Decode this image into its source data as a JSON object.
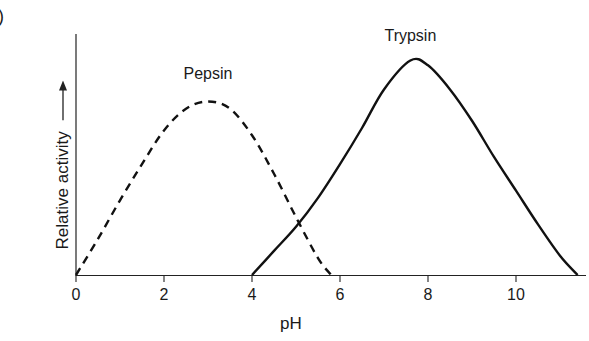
{
  "panel_mark": ")",
  "chart_data": {
    "type": "line",
    "title": "",
    "xlabel": "pH",
    "ylabel": "Relative activity",
    "ylabel_arrow": "→",
    "xlim": [
      0,
      11.4
    ],
    "ylim": [
      0,
      1
    ],
    "xticks": [
      0,
      2,
      4,
      6,
      8,
      10
    ],
    "xtick_labels": [
      "0",
      "2",
      "4",
      "6",
      "8",
      "10"
    ],
    "yticks": [],
    "grid": false,
    "legend": "none (curves labeled inline)",
    "series": [
      {
        "name": "Pepsin",
        "style": "dashed",
        "color": "#111111",
        "label_position": {
          "x": 3.0,
          "y": 0.82
        },
        "points": [
          [
            0,
            0
          ],
          [
            0.5,
            0.15
          ],
          [
            1,
            0.31
          ],
          [
            1.5,
            0.46
          ],
          [
            2,
            0.6
          ],
          [
            2.5,
            0.69
          ],
          [
            3,
            0.72
          ],
          [
            3.5,
            0.69
          ],
          [
            4,
            0.58
          ],
          [
            4.5,
            0.42
          ],
          [
            5,
            0.24
          ],
          [
            5.5,
            0.07
          ],
          [
            5.8,
            0
          ]
        ]
      },
      {
        "name": "Trypsin",
        "style": "solid",
        "color": "#111111",
        "label_position": {
          "x": 7.6,
          "y": 0.98
        },
        "points": [
          [
            4,
            0
          ],
          [
            4.5,
            0.1
          ],
          [
            5,
            0.2
          ],
          [
            5.5,
            0.32
          ],
          [
            6,
            0.46
          ],
          [
            6.5,
            0.61
          ],
          [
            7,
            0.77
          ],
          [
            7.6,
            0.89
          ],
          [
            8,
            0.87
          ],
          [
            8.5,
            0.77
          ],
          [
            9,
            0.64
          ],
          [
            9.5,
            0.49
          ],
          [
            10,
            0.35
          ],
          [
            10.5,
            0.21
          ],
          [
            11,
            0.08
          ],
          [
            11.4,
            0
          ]
        ]
      }
    ],
    "annotations": [
      "Curves intersect near pH 4.9"
    ]
  }
}
